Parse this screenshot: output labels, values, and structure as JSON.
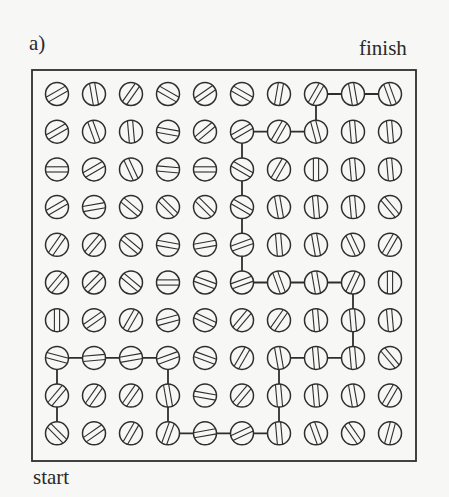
{
  "figure": {
    "panel_label": "a)",
    "finish_label": "finish",
    "start_label": "start",
    "colors": {
      "ink": "#2e2e2e",
      "background": "#f7f7f5"
    },
    "grid": {
      "rows": 10,
      "cols": 10,
      "cell_description": "circle with two parallel lines; angle in degrees (0 = horizontal, 90 = vertical, 45 = '/', 135 = '\\')",
      "angles": [
        [
          30,
          100,
          55,
          150,
          35,
          150,
          80,
          60,
          100,
          110
        ],
        [
          30,
          110,
          95,
          170,
          40,
          30,
          60,
          105,
          95,
          95
        ],
        [
          0,
          30,
          115,
          175,
          0,
          150,
          60,
          90,
          95,
          95
        ],
        [
          30,
          10,
          140,
          135,
          135,
          150,
          100,
          95,
          95,
          130
        ],
        [
          55,
          50,
          140,
          170,
          10,
          20,
          95,
          100,
          115,
          60
        ],
        [
          50,
          45,
          140,
          0,
          160,
          20,
          110,
          100,
          65,
          90
        ],
        [
          90,
          35,
          60,
          15,
          155,
          50,
          55,
          95,
          95,
          95
        ],
        [
          165,
          5,
          10,
          20,
          160,
          60,
          100,
          95,
          95,
          130
        ],
        [
          50,
          55,
          55,
          100,
          170,
          50,
          95,
          95,
          100,
          60
        ],
        [
          135,
          35,
          60,
          70,
          10,
          25,
          95,
          110,
          125,
          75
        ]
      ]
    },
    "path": [
      [
        9,
        0
      ],
      [
        8,
        0
      ],
      [
        7,
        0
      ],
      [
        7,
        1
      ],
      [
        7,
        2
      ],
      [
        7,
        3
      ],
      [
        8,
        3
      ],
      [
        9,
        3
      ],
      [
        9,
        4
      ],
      [
        9,
        5
      ],
      [
        9,
        6
      ],
      [
        8,
        6
      ],
      [
        7,
        6
      ],
      [
        7,
        7
      ],
      [
        7,
        8
      ],
      [
        6,
        8
      ],
      [
        5,
        8
      ],
      [
        5,
        7
      ],
      [
        5,
        6
      ],
      [
        5,
        5
      ],
      [
        4,
        5
      ],
      [
        3,
        5
      ],
      [
        2,
        5
      ],
      [
        1,
        5
      ],
      [
        1,
        6
      ],
      [
        1,
        7
      ],
      [
        0,
        7
      ],
      [
        0,
        8
      ],
      [
        0,
        9
      ]
    ]
  }
}
